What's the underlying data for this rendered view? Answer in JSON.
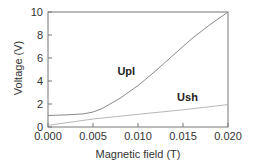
{
  "chart_data": {
    "type": "line",
    "title": "",
    "xlabel": "Magnetic field (T)",
    "ylabel": "Voltage (V)",
    "xlim": [
      0.0,
      0.02
    ],
    "ylim": [
      0,
      10
    ],
    "xticks": [
      "0.000",
      "0.005",
      "0.010",
      "0.015",
      "0.020"
    ],
    "yticks": [
      "0",
      "2",
      "4",
      "6",
      "8",
      "10"
    ],
    "grid": false,
    "legend": "none (inline curve labels)",
    "series": [
      {
        "name": "Upl",
        "color": "#8a8a8a",
        "x": [
          0.0,
          0.002,
          0.004,
          0.005,
          0.006,
          0.008,
          0.01,
          0.012,
          0.014,
          0.016,
          0.018,
          0.02
        ],
        "values": [
          1.0,
          1.05,
          1.15,
          1.3,
          1.6,
          2.5,
          3.6,
          4.9,
          6.3,
          7.7,
          8.9,
          10.0
        ]
      },
      {
        "name": "Ush",
        "color": "#b8b8b8",
        "x": [
          0.0,
          0.005,
          0.01,
          0.015,
          0.02
        ],
        "values": [
          0.15,
          0.7,
          1.1,
          1.5,
          1.95
        ]
      }
    ],
    "annotations": [
      {
        "text": "Upl",
        "x": 0.0087,
        "y": 4.5
      },
      {
        "text": "Ush",
        "x": 0.0155,
        "y": 2.3
      }
    ]
  }
}
